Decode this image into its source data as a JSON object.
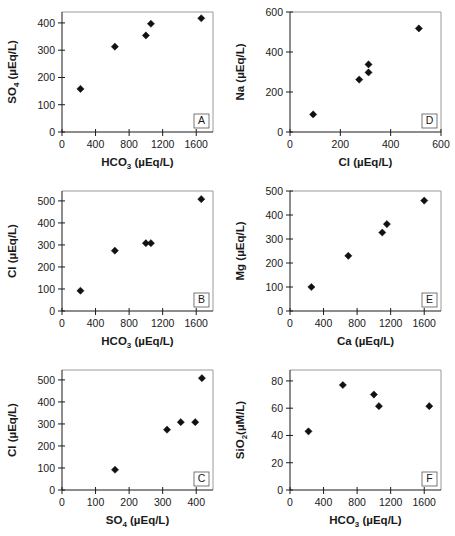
{
  "figure": {
    "title": "",
    "panel_count": 6,
    "marker_style": "filled diamond",
    "marker_color": "#111111",
    "background": "#ffffff"
  },
  "chart_data": [
    {
      "type": "scatter",
      "panel": "A",
      "title": "",
      "xlabel": "HCO3 (µEq/L)",
      "xlabel_main": "HCO",
      "xlabel_sub": "3",
      "xlabel_unit": " (µEq/L)",
      "ylabel": "SO4 (µEq/L)",
      "ylabel_main": "SO",
      "ylabel_sub": "4",
      "ylabel_unit": " (µEq/L)",
      "xlim": [
        0,
        1800
      ],
      "ylim": [
        0,
        440
      ],
      "xticks": [
        0,
        400,
        800,
        1200,
        1600
      ],
      "yticks": [
        0,
        100,
        200,
        300,
        400
      ],
      "grid": false,
      "x": [
        220,
        630,
        1000,
        1060,
        1660
      ],
      "y": [
        158,
        313,
        354,
        397,
        417
      ],
      "points": [
        {
          "x": 220,
          "y": 158
        },
        {
          "x": 630,
          "y": 313
        },
        {
          "x": 1000,
          "y": 354
        },
        {
          "x": 1060,
          "y": 397
        },
        {
          "x": 1660,
          "y": 417
        }
      ]
    },
    {
      "type": "scatter",
      "panel": "D",
      "title": "",
      "xlabel": "Cl (µEq/L)",
      "xlabel_main": "Cl",
      "xlabel_sub": "",
      "xlabel_unit": " (µEq/L)",
      "ylabel": "Na (µEq/L)",
      "ylabel_main": "Na",
      "ylabel_sub": "",
      "ylabel_unit": " (µEq/L)",
      "xlim": [
        0,
        600
      ],
      "ylim": [
        0,
        600
      ],
      "xticks": [
        0,
        200,
        400,
        600
      ],
      "yticks": [
        0,
        200,
        400,
        600
      ],
      "grid": false,
      "x": [
        92,
        275,
        312,
        312,
        512
      ],
      "y": [
        88,
        262,
        298,
        338,
        518
      ],
      "points": [
        {
          "x": 92,
          "y": 88
        },
        {
          "x": 275,
          "y": 262
        },
        {
          "x": 312,
          "y": 298
        },
        {
          "x": 312,
          "y": 338
        },
        {
          "x": 512,
          "y": 518
        }
      ]
    },
    {
      "type": "scatter",
      "panel": "B",
      "title": "",
      "xlabel": "HCO3 (µEq/L)",
      "xlabel_main": "HCO",
      "xlabel_sub": "3",
      "xlabel_unit": " (µEq/L)",
      "ylabel": "Cl (µEq/L)",
      "ylabel_main": "Cl",
      "ylabel_sub": "",
      "ylabel_unit": " (µEq/L)",
      "xlim": [
        0,
        1800
      ],
      "ylim": [
        0,
        545
      ],
      "xticks": [
        0,
        400,
        800,
        1200,
        1600
      ],
      "yticks": [
        0,
        100,
        200,
        300,
        400,
        500
      ],
      "grid": false,
      "x": [
        220,
        630,
        1000,
        1060,
        1660
      ],
      "y": [
        92,
        274,
        308,
        308,
        508
      ],
      "points": [
        {
          "x": 220,
          "y": 92
        },
        {
          "x": 630,
          "y": 274
        },
        {
          "x": 1000,
          "y": 308
        },
        {
          "x": 1060,
          "y": 308
        },
        {
          "x": 1660,
          "y": 508
        }
      ]
    },
    {
      "type": "scatter",
      "panel": "E",
      "title": "",
      "xlabel": "Ca (µEq/L)",
      "xlabel_main": "Ca",
      "xlabel_sub": "",
      "xlabel_unit": " (µEq/L)",
      "ylabel": "Mg (µEq/L)",
      "ylabel_main": "Mg",
      "ylabel_sub": "",
      "ylabel_unit": " (µEq/L)",
      "xlim": [
        0,
        1800
      ],
      "ylim": [
        0,
        500
      ],
      "xticks": [
        0,
        400,
        800,
        1200,
        1600
      ],
      "yticks": [
        0,
        100,
        200,
        300,
        400,
        500
      ],
      "grid": false,
      "x": [
        255,
        695,
        1100,
        1155,
        1600
      ],
      "y": [
        100,
        230,
        327,
        362,
        460
      ],
      "points": [
        {
          "x": 255,
          "y": 100
        },
        {
          "x": 695,
          "y": 230
        },
        {
          "x": 1100,
          "y": 327
        },
        {
          "x": 1155,
          "y": 362
        },
        {
          "x": 1600,
          "y": 460
        }
      ]
    },
    {
      "type": "scatter",
      "panel": "C",
      "title": "",
      "xlabel": "SO4 (µEq/L)",
      "xlabel_main": "SO",
      "xlabel_sub": "4",
      "xlabel_unit": " (µEq/L)",
      "ylabel": "Cl (µEq/L)",
      "ylabel_main": "Cl",
      "ylabel_sub": "",
      "ylabel_unit": " (µEq/L)",
      "xlim": [
        0,
        450
      ],
      "ylim": [
        0,
        545
      ],
      "xticks": [
        0,
        100,
        200,
        300,
        400
      ],
      "yticks": [
        0,
        100,
        200,
        300,
        400,
        500
      ],
      "grid": false,
      "x": [
        158,
        313,
        354,
        397,
        417
      ],
      "y": [
        92,
        274,
        308,
        308,
        508
      ],
      "points": [
        {
          "x": 158,
          "y": 92
        },
        {
          "x": 313,
          "y": 274
        },
        {
          "x": 354,
          "y": 308
        },
        {
          "x": 397,
          "y": 308
        },
        {
          "x": 417,
          "y": 508
        }
      ]
    },
    {
      "type": "scatter",
      "panel": "F",
      "title": "",
      "xlabel": "HCO3 (µEq/L)",
      "xlabel_main": "HCO",
      "xlabel_sub": "3",
      "xlabel_unit": " (µEq/L)",
      "ylabel": "SiO2(µM/L)",
      "ylabel_main": "SiO",
      "ylabel_sub": "2",
      "ylabel_unit": "(µM/L)",
      "xlim": [
        0,
        1800
      ],
      "ylim": [
        0,
        88
      ],
      "xticks": [
        0,
        400,
        800,
        1200,
        1600
      ],
      "yticks": [
        0,
        20,
        40,
        60,
        80
      ],
      "grid": false,
      "x": [
        220,
        630,
        1000,
        1060,
        1660
      ],
      "y": [
        43,
        77,
        70,
        61.5,
        61.5
      ],
      "points": [
        {
          "x": 220,
          "y": 43
        },
        {
          "x": 630,
          "y": 77
        },
        {
          "x": 1000,
          "y": 70
        },
        {
          "x": 1060,
          "y": 61.5
        },
        {
          "x": 1660,
          "y": 61.5
        }
      ]
    }
  ]
}
